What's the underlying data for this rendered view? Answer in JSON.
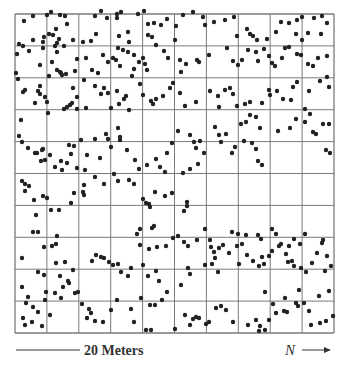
{
  "figure": {
    "scale_label": "20 Meters",
    "north_label": "N",
    "dot_color": "#222222",
    "grid_color": "#7a7a7a"
  },
  "chart_data": {
    "type": "scatter",
    "title": "",
    "xlabel": "20 Meters",
    "ylabel": "",
    "direction_label": "N →",
    "grid": {
      "rows": 10,
      "cols": 10,
      "on": true
    },
    "xlim": [
      0,
      20
    ],
    "ylim": [
      0,
      20
    ],
    "plot_px": {
      "left": 15,
      "top": 14,
      "right": 334,
      "bottom": 333
    },
    "points_px": [
      [
        24,
        21
      ],
      [
        33,
        40
      ],
      [
        43,
        42
      ],
      [
        44,
        37
      ],
      [
        49,
        34
      ],
      [
        43,
        48
      ],
      [
        19,
        44
      ],
      [
        23,
        46
      ],
      [
        33,
        16
      ],
      [
        47,
        15
      ],
      [
        51,
        12
      ],
      [
        60,
        15
      ],
      [
        65,
        16
      ],
      [
        67,
        24
      ],
      [
        56,
        29
      ],
      [
        53,
        35
      ],
      [
        59,
        39
      ],
      [
        57,
        43
      ],
      [
        55,
        46
      ],
      [
        57,
        52
      ],
      [
        64,
        46
      ],
      [
        73,
        40
      ],
      [
        83,
        42
      ],
      [
        91,
        41
      ],
      [
        96,
        34
      ],
      [
        95,
        16
      ],
      [
        101,
        11
      ],
      [
        107,
        18
      ],
      [
        117,
        18
      ],
      [
        119,
        36
      ],
      [
        129,
        42
      ],
      [
        117,
        14
      ],
      [
        121,
        12
      ],
      [
        128,
        32
      ],
      [
        138,
        14
      ],
      [
        144,
        11
      ],
      [
        148,
        24
      ],
      [
        154,
        23
      ],
      [
        148,
        35
      ],
      [
        152,
        37
      ],
      [
        161,
        25
      ],
      [
        167,
        19
      ],
      [
        176,
        26
      ],
      [
        175,
        40
      ],
      [
        183,
        15
      ],
      [
        193,
        12
      ],
      [
        203,
        17
      ],
      [
        205,
        25
      ],
      [
        214,
        22
      ],
      [
        225,
        20
      ],
      [
        234,
        17
      ],
      [
        237,
        36
      ],
      [
        247,
        29
      ],
      [
        250,
        34
      ],
      [
        253,
        36
      ],
      [
        257,
        40
      ],
      [
        267,
        39
      ],
      [
        276,
        32
      ],
      [
        281,
        22
      ],
      [
        289,
        23
      ],
      [
        297,
        20
      ],
      [
        302,
        17
      ],
      [
        314,
        18
      ],
      [
        322,
        16
      ],
      [
        321,
        34
      ],
      [
        302,
        40
      ],
      [
        308,
        33
      ],
      [
        296,
        34
      ],
      [
        327,
        23
      ],
      [
        17,
        54
      ],
      [
        16,
        73
      ],
      [
        29,
        51
      ],
      [
        40,
        65
      ],
      [
        52,
        62
      ],
      [
        57,
        70
      ],
      [
        60,
        72
      ],
      [
        62,
        75
      ],
      [
        66,
        74
      ],
      [
        75,
        71
      ],
      [
        77,
        59
      ],
      [
        86,
        58
      ],
      [
        92,
        70
      ],
      [
        98,
        73
      ],
      [
        84,
        80
      ],
      [
        103,
        55
      ],
      [
        108,
        62
      ],
      [
        113,
        58
      ],
      [
        116,
        60
      ],
      [
        120,
        66
      ],
      [
        128,
        52
      ],
      [
        134,
        55
      ],
      [
        134,
        69
      ],
      [
        132,
        76
      ],
      [
        118,
        48
      ],
      [
        123,
        50
      ],
      [
        139,
        62
      ],
      [
        143,
        58
      ],
      [
        145,
        64
      ],
      [
        147,
        70
      ],
      [
        156,
        45
      ],
      [
        164,
        51
      ],
      [
        168,
        58
      ],
      [
        180,
        60
      ],
      [
        186,
        64
      ],
      [
        181,
        72
      ],
      [
        197,
        60
      ],
      [
        199,
        62
      ],
      [
        209,
        55
      ],
      [
        227,
        48
      ],
      [
        233,
        61
      ],
      [
        238,
        65
      ],
      [
        242,
        60
      ],
      [
        248,
        50
      ],
      [
        256,
        52
      ],
      [
        258,
        61
      ],
      [
        264,
        49
      ],
      [
        269,
        56
      ],
      [
        272,
        63
      ],
      [
        275,
        66
      ],
      [
        282,
        58
      ],
      [
        285,
        48
      ],
      [
        289,
        47
      ],
      [
        297,
        54
      ],
      [
        301,
        55
      ],
      [
        308,
        64
      ],
      [
        313,
        66
      ],
      [
        318,
        58
      ],
      [
        327,
        56
      ],
      [
        18,
        79
      ],
      [
        23,
        92
      ],
      [
        25,
        90
      ],
      [
        40,
        86
      ],
      [
        38,
        91
      ],
      [
        40,
        94
      ],
      [
        45,
        97
      ],
      [
        47,
        102
      ],
      [
        35,
        103
      ],
      [
        48,
        113
      ],
      [
        21,
        120
      ],
      [
        49,
        76
      ],
      [
        61,
        73
      ],
      [
        73,
        88
      ],
      [
        77,
        97
      ],
      [
        64,
        109
      ],
      [
        67,
        107
      ],
      [
        70,
        105
      ],
      [
        72,
        103
      ],
      [
        77,
        109
      ],
      [
        86,
        108
      ],
      [
        95,
        86
      ],
      [
        101,
        94
      ],
      [
        104,
        88
      ],
      [
        108,
        93
      ],
      [
        111,
        108
      ],
      [
        117,
        91
      ],
      [
        119,
        104
      ],
      [
        124,
        99
      ],
      [
        126,
        96
      ],
      [
        129,
        110
      ],
      [
        143,
        95
      ],
      [
        140,
        84
      ],
      [
        151,
        101
      ],
      [
        153,
        104
      ],
      [
        156,
        99
      ],
      [
        163,
        96
      ],
      [
        170,
        88
      ],
      [
        173,
        83
      ],
      [
        180,
        93
      ],
      [
        185,
        106
      ],
      [
        196,
        102
      ],
      [
        210,
        91
      ],
      [
        218,
        96
      ],
      [
        219,
        107
      ],
      [
        225,
        90
      ],
      [
        230,
        88
      ],
      [
        233,
        94
      ],
      [
        237,
        106
      ],
      [
        245,
        104
      ],
      [
        250,
        102
      ],
      [
        250,
        115
      ],
      [
        262,
        103
      ],
      [
        269,
        90
      ],
      [
        270,
        95
      ],
      [
        277,
        91
      ],
      [
        283,
        99
      ],
      [
        291,
        100
      ],
      [
        293,
        87
      ],
      [
        297,
        82
      ],
      [
        309,
        91
      ],
      [
        320,
        81
      ],
      [
        327,
        77
      ],
      [
        329,
        87
      ],
      [
        19,
        136
      ],
      [
        22,
        142
      ],
      [
        28,
        148
      ],
      [
        35,
        153
      ],
      [
        42,
        150
      ],
      [
        37,
        153
      ],
      [
        45,
        160
      ],
      [
        43,
        149
      ],
      [
        41,
        161
      ],
      [
        50,
        155
      ],
      [
        55,
        167
      ],
      [
        61,
        161
      ],
      [
        62,
        170
      ],
      [
        67,
        163
      ],
      [
        71,
        154
      ],
      [
        74,
        146
      ],
      [
        81,
        140
      ],
      [
        69,
        145
      ],
      [
        77,
        168
      ],
      [
        85,
        170
      ],
      [
        87,
        155
      ],
      [
        95,
        139
      ],
      [
        106,
        134
      ],
      [
        108,
        139
      ],
      [
        111,
        147
      ],
      [
        100,
        158
      ],
      [
        118,
        128
      ],
      [
        120,
        137
      ],
      [
        120,
        140
      ],
      [
        127,
        150
      ],
      [
        135,
        160
      ],
      [
        139,
        169
      ],
      [
        147,
        165
      ],
      [
        156,
        159
      ],
      [
        160,
        167
      ],
      [
        165,
        172
      ],
      [
        167,
        153
      ],
      [
        172,
        143
      ],
      [
        178,
        131
      ],
      [
        190,
        135
      ],
      [
        194,
        142
      ],
      [
        196,
        148
      ],
      [
        200,
        141
      ],
      [
        204,
        153
      ],
      [
        198,
        164
      ],
      [
        190,
        169
      ],
      [
        183,
        173
      ],
      [
        215,
        127
      ],
      [
        219,
        135
      ],
      [
        221,
        142
      ],
      [
        226,
        134
      ],
      [
        232,
        153
      ],
      [
        235,
        147
      ],
      [
        244,
        141
      ],
      [
        252,
        143
      ],
      [
        256,
        149
      ],
      [
        258,
        161
      ],
      [
        262,
        165
      ],
      [
        241,
        124
      ],
      [
        246,
        122
      ],
      [
        256,
        117
      ],
      [
        260,
        128
      ],
      [
        278,
        131
      ],
      [
        290,
        128
      ],
      [
        296,
        119
      ],
      [
        305,
        109
      ],
      [
        310,
        114
      ],
      [
        305,
        122
      ],
      [
        313,
        132
      ],
      [
        323,
        124
      ],
      [
        329,
        124
      ],
      [
        316,
        134
      ],
      [
        326,
        150
      ],
      [
        330,
        153
      ],
      [
        22,
        181
      ],
      [
        25,
        184
      ],
      [
        25,
        191
      ],
      [
        29,
        186
      ],
      [
        34,
        200
      ],
      [
        36,
        215
      ],
      [
        43,
        196
      ],
      [
        47,
        198
      ],
      [
        51,
        210
      ],
      [
        59,
        210
      ],
      [
        71,
        203
      ],
      [
        74,
        193
      ],
      [
        84,
        185
      ],
      [
        84,
        195
      ],
      [
        83,
        192
      ],
      [
        95,
        177
      ],
      [
        104,
        184
      ],
      [
        114,
        174
      ],
      [
        118,
        181
      ],
      [
        129,
        180
      ],
      [
        134,
        184
      ],
      [
        143,
        199
      ],
      [
        146,
        203
      ],
      [
        149,
        204
      ],
      [
        150,
        207
      ],
      [
        155,
        192
      ],
      [
        165,
        196
      ],
      [
        172,
        193
      ],
      [
        187,
        202
      ],
      [
        187,
        206
      ],
      [
        184,
        211
      ],
      [
        137,
        234
      ],
      [
        140,
        229
      ],
      [
        152,
        228
      ],
      [
        154,
        226
      ],
      [
        140,
        245
      ],
      [
        149,
        249
      ],
      [
        157,
        247
      ],
      [
        166,
        246
      ],
      [
        173,
        238
      ],
      [
        178,
        236
      ],
      [
        184,
        242
      ],
      [
        188,
        246
      ],
      [
        197,
        240
      ],
      [
        205,
        229
      ],
      [
        210,
        240
      ],
      [
        211,
        247
      ],
      [
        214,
        252
      ],
      [
        219,
        248
      ],
      [
        223,
        245
      ],
      [
        232,
        232
      ],
      [
        238,
        234
      ],
      [
        242,
        244
      ],
      [
        246,
        235
      ],
      [
        258,
        235
      ],
      [
        261,
        239
      ],
      [
        272,
        229
      ],
      [
        276,
        234
      ],
      [
        281,
        244
      ],
      [
        289,
        246
      ],
      [
        294,
        239
      ],
      [
        33,
        232
      ],
      [
        38,
        232
      ],
      [
        44,
        247
      ],
      [
        52,
        246
      ],
      [
        56,
        244
      ],
      [
        57,
        236
      ],
      [
        22,
        258
      ],
      [
        38,
        272
      ],
      [
        44,
        275
      ],
      [
        56,
        263
      ],
      [
        65,
        262
      ],
      [
        60,
        276
      ],
      [
        69,
        283
      ],
      [
        73,
        270
      ],
      [
        92,
        261
      ],
      [
        96,
        255
      ],
      [
        101,
        257
      ],
      [
        104,
        258
      ],
      [
        109,
        262
      ],
      [
        113,
        265
      ],
      [
        118,
        264
      ],
      [
        121,
        272
      ],
      [
        128,
        276
      ],
      [
        131,
        268
      ],
      [
        143,
        265
      ],
      [
        148,
        276
      ],
      [
        156,
        271
      ],
      [
        159,
        281
      ],
      [
        181,
        285
      ],
      [
        188,
        268
      ],
      [
        190,
        274
      ],
      [
        205,
        265
      ],
      [
        212,
        264
      ],
      [
        215,
        258
      ],
      [
        218,
        272
      ],
      [
        229,
        253
      ],
      [
        237,
        246
      ],
      [
        239,
        264
      ],
      [
        247,
        255
      ],
      [
        253,
        261
      ],
      [
        259,
        266
      ],
      [
        262,
        257
      ],
      [
        264,
        264
      ],
      [
        269,
        256
      ],
      [
        272,
        251
      ],
      [
        279,
        246
      ],
      [
        288,
        262
      ],
      [
        292,
        261
      ],
      [
        294,
        266
      ],
      [
        301,
        268
      ],
      [
        306,
        272
      ],
      [
        312,
        263
      ],
      [
        317,
        253
      ],
      [
        322,
        243
      ],
      [
        323,
        240
      ],
      [
        327,
        256
      ],
      [
        331,
        266
      ],
      [
        325,
        271
      ],
      [
        286,
        254
      ],
      [
        300,
        244
      ],
      [
        305,
        234
      ],
      [
        22,
        287
      ],
      [
        26,
        303
      ],
      [
        33,
        307
      ],
      [
        28,
        297
      ],
      [
        38,
        312
      ],
      [
        45,
        300
      ],
      [
        46,
        292
      ],
      [
        55,
        293
      ],
      [
        50,
        315
      ],
      [
        42,
        326
      ],
      [
        32,
        322
      ],
      [
        25,
        325
      ],
      [
        23,
        318
      ],
      [
        61,
        298
      ],
      [
        63,
        287
      ],
      [
        68,
        281
      ],
      [
        75,
        293
      ],
      [
        78,
        292
      ],
      [
        82,
        304
      ],
      [
        87,
        318
      ],
      [
        91,
        313
      ],
      [
        89,
        309
      ],
      [
        95,
        321
      ],
      [
        103,
        322
      ],
      [
        111,
        310
      ],
      [
        117,
        300
      ],
      [
        131,
        309
      ],
      [
        141,
        298
      ],
      [
        150,
        305
      ],
      [
        155,
        305
      ],
      [
        162,
        300
      ],
      [
        167,
        292
      ],
      [
        134,
        322
      ],
      [
        146,
        330
      ],
      [
        151,
        330
      ],
      [
        185,
        315
      ],
      [
        175,
        329
      ],
      [
        190,
        325
      ],
      [
        193,
        319
      ],
      [
        196,
        317
      ],
      [
        199,
        318
      ],
      [
        206,
        324
      ],
      [
        209,
        322
      ],
      [
        216,
        308
      ],
      [
        221,
        306
      ],
      [
        226,
        310
      ],
      [
        233,
        322
      ],
      [
        248,
        325
      ],
      [
        256,
        320
      ],
      [
        260,
        326
      ],
      [
        259,
        331
      ],
      [
        265,
        330
      ],
      [
        269,
        320
      ],
      [
        276,
        313
      ],
      [
        284,
        311
      ],
      [
        287,
        312
      ],
      [
        296,
        303
      ],
      [
        298,
        306
      ],
      [
        304,
        303
      ],
      [
        309,
        311
      ],
      [
        311,
        325
      ],
      [
        320,
        323
      ],
      [
        326,
        321
      ],
      [
        333,
        316
      ],
      [
        319,
        296
      ],
      [
        329,
        291
      ],
      [
        299,
        290
      ],
      [
        285,
        298
      ],
      [
        273,
        304
      ],
      [
        265,
        292
      ]
    ]
  }
}
